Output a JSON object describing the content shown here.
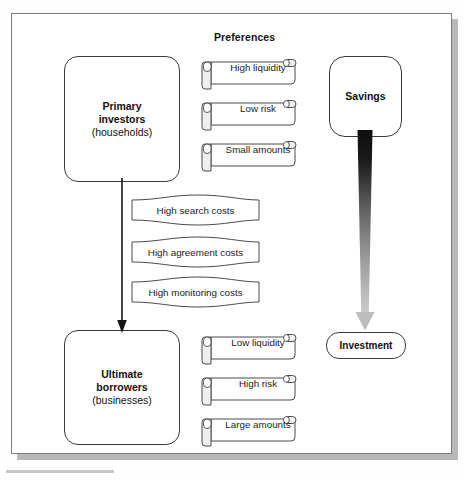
{
  "diagram": {
    "headings": {
      "preferences": "Preferences"
    },
    "entities": {
      "primary_investors": {
        "line1": "Primary",
        "line2": "investors",
        "line3": "(households)"
      },
      "ultimate_borrowers": {
        "line1": "Ultimate",
        "line2": "borrowers",
        "line3": "(businesses)"
      },
      "savings": {
        "label": "Savings"
      },
      "investment": {
        "label": "Investment"
      }
    },
    "investor_preferences": [
      {
        "label": "High liquidity"
      },
      {
        "label": "Low risk"
      },
      {
        "label": "Small amounts"
      }
    ],
    "borrower_preferences": [
      {
        "label": "Low liquidity"
      },
      {
        "label": "High risk"
      },
      {
        "label": "Large amounts"
      }
    ],
    "frictions": [
      {
        "label": "High search costs"
      },
      {
        "label": "High agreement costs"
      },
      {
        "label": "High monitoring costs"
      }
    ],
    "connectors": {
      "flow_arrow": {
        "from": "Primary investors",
        "to": "Ultimate borrowers",
        "style": "thin-black-down-arrow"
      },
      "savings_arrow": {
        "from": "Savings",
        "to": "Investment",
        "style": "tapered-gradient-down-arrow"
      }
    },
    "colors": {
      "outline": "#3a3a3a",
      "frame_border": "#7d7d7d",
      "frame_shadow": "#b9b9b9",
      "paper": "#ffffff",
      "text": "#111111",
      "arrow_dark": "#111111",
      "arrow_light": "#c9c9c9",
      "scroll_fill": "#ffffff",
      "roll_shade": "#e8e8e8"
    }
  }
}
